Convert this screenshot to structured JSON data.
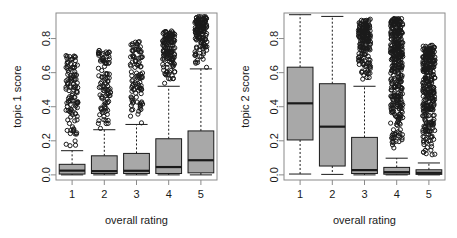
{
  "figure": {
    "background": "#ffffff",
    "box_fill": "#a8a8a8",
    "line_color": "#1a1a1a",
    "frame_color": "#8a8a8a"
  },
  "chart_data": [
    {
      "type": "box",
      "panel": "left",
      "title": "",
      "xlabel": "overall rating",
      "ylabel": "topic 1 score",
      "categories": [
        "1",
        "2",
        "3",
        "4",
        "5"
      ],
      "xtick_labels": [
        "1",
        "2",
        "3",
        "4",
        "5"
      ],
      "ytick_labels": [
        "0.0",
        "0.2",
        "0.4",
        "0.6",
        "0.8"
      ],
      "ytick_values": [
        0.0,
        0.2,
        0.4,
        0.6,
        0.8
      ],
      "ylim": [
        -0.03,
        0.95
      ],
      "grid": false,
      "legend": "none",
      "boxes": [
        {
          "category": "1",
          "whisker_low": 0.0,
          "q1": 0.005,
          "median": 0.025,
          "q3": 0.062,
          "whisker_high": 0.142,
          "outlier_min": 0.15,
          "outlier_max": 0.7,
          "outlier_density": "dense-low"
        },
        {
          "category": "2",
          "whisker_low": 0.0,
          "q1": 0.008,
          "median": 0.022,
          "q3": 0.112,
          "whisker_high": 0.265,
          "outlier_min": 0.27,
          "outlier_max": 0.735,
          "outlier_density": "dense-low"
        },
        {
          "category": "3",
          "whisker_low": 0.0,
          "q1": 0.008,
          "median": 0.024,
          "q3": 0.126,
          "whisker_high": 0.296,
          "outlier_min": 0.3,
          "outlier_max": 0.782,
          "outlier_density": "dense-low"
        },
        {
          "category": "4",
          "whisker_low": 0.0,
          "q1": 0.008,
          "median": 0.046,
          "q3": 0.212,
          "whisker_high": 0.52,
          "outlier_min": 0.525,
          "outlier_max": 0.845,
          "outlier_density": "very-dense"
        },
        {
          "category": "5",
          "whisker_low": 0.0,
          "q1": 0.012,
          "median": 0.086,
          "q3": 0.258,
          "whisker_high": 0.622,
          "outlier_min": 0.628,
          "outlier_max": 0.93,
          "outlier_density": "very-dense"
        }
      ]
    },
    {
      "type": "box",
      "panel": "right",
      "title": "",
      "xlabel": "overall rating",
      "ylabel": "topic 2 score",
      "categories": [
        "1",
        "2",
        "3",
        "4",
        "5"
      ],
      "xtick_labels": [
        "1",
        "2",
        "3",
        "4",
        "5"
      ],
      "ytick_labels": [
        "0.0",
        "0.2",
        "0.4",
        "0.6",
        "0.8"
      ],
      "ytick_values": [
        0.0,
        0.2,
        0.4,
        0.6,
        0.8
      ],
      "ylim": [
        -0.03,
        0.95
      ],
      "grid": false,
      "legend": "none",
      "boxes": [
        {
          "category": "1",
          "whisker_low": 0.005,
          "q1": 0.205,
          "median": 0.42,
          "q3": 0.632,
          "whisker_high": 0.94,
          "outlier_min": null,
          "outlier_max": null,
          "outlier_density": "none"
        },
        {
          "category": "2",
          "whisker_low": 0.003,
          "q1": 0.052,
          "median": 0.283,
          "q3": 0.535,
          "whisker_high": 0.93,
          "outlier_min": null,
          "outlier_max": null,
          "outlier_density": "none"
        },
        {
          "category": "3",
          "whisker_low": 0.0,
          "q1": 0.008,
          "median": 0.028,
          "q3": 0.22,
          "whisker_high": 0.52,
          "outlier_min": 0.525,
          "outlier_max": 0.915,
          "outlier_density": "very-dense"
        },
        {
          "category": "4",
          "whisker_low": 0.0,
          "q1": 0.004,
          "median": 0.016,
          "q3": 0.044,
          "whisker_high": 0.098,
          "outlier_min": 0.1,
          "outlier_max": 0.918,
          "outlier_density": "very-dense"
        },
        {
          "category": "5",
          "whisker_low": 0.0,
          "q1": 0.003,
          "median": 0.012,
          "q3": 0.03,
          "whisker_high": 0.07,
          "outlier_min": 0.075,
          "outlier_max": 0.762,
          "outlier_density": "very-dense"
        }
      ]
    }
  ]
}
